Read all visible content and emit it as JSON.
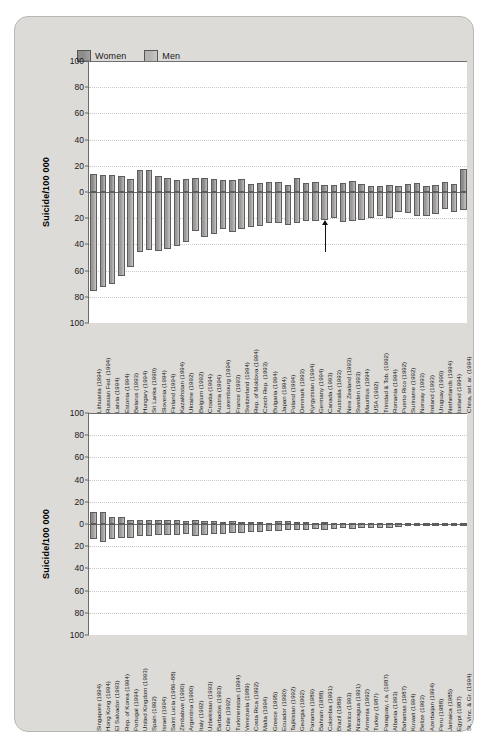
{
  "figure": {
    "background_color": "#dddbd8",
    "plot_background": "#ffffff",
    "legend": [
      {
        "key": "women",
        "label": "Women",
        "color": "#8e8d8b"
      },
      {
        "key": "men",
        "label": "Men",
        "color": "#b6b5b3"
      }
    ]
  },
  "chart_data": [
    {
      "id": "panel-top",
      "type": "bar",
      "orientation": "vertical-diverging",
      "title": "",
      "xlabel": "",
      "ylabel": "Suicide/100 000",
      "ylim": [
        -100,
        100
      ],
      "grid": true,
      "legend_position": "top-left",
      "ytick_labels": [
        "100",
        "80",
        "60",
        "40",
        "20",
        "0",
        "20",
        "40",
        "60",
        "80",
        "100"
      ],
      "ytick_values": [
        100,
        80,
        60,
        40,
        20,
        0,
        -20,
        -40,
        -60,
        -80,
        -100
      ],
      "note": "Women plotted above zero, Men plotted below zero (absolute rates). Sorted by descending male rate.",
      "series": [
        {
          "name": "Women",
          "direction": "up"
        },
        {
          "name": "Men",
          "direction": "down"
        }
      ],
      "categories": [
        "Lithuania (1994)",
        "Russian Fed. (1994)",
        "Latvia (1994)",
        "Estonia (1994)",
        "Belarus (1993)",
        "Hungary (1994)",
        "Sri Lanka (1990)",
        "Slovenia (1994)",
        "Finland (1994)",
        "Kazakhstan (1994)",
        "Ukraine (1992)",
        "Belgium (1992)",
        "Croatia (1994)",
        "Austria (1994)",
        "Luxembourg (1994)",
        "France (1993)",
        "Switzerland (1994)",
        "Rep. of Moldova (1994)",
        "Czech Rep. (1993)",
        "Bulgaria (1994)",
        "Japan (1994)",
        "Poland (1994)",
        "Denmark (1993)",
        "Kyrgyzstan (1994)",
        "Germany (1994)",
        "Canada (1993)",
        "Australia (1993)",
        "New Zealand (1993)",
        "Sweden (1993)",
        "Mauritius (1994)",
        "USA (1992)",
        "Trinidad & Tob. (1992)",
        "Romania (1994)",
        "Puerto Rico (1992)",
        "Suriname (1992)",
        "Norway (1993)",
        "Ireland (1993)",
        "Uruguay (1990)",
        "Netherlands (1994)",
        "Iceland (1994)",
        "China, sel. ar. (1994)"
      ],
      "women_values": [
        13.4,
        12.6,
        13.0,
        12.0,
        9.6,
        16.8,
        16.6,
        12.0,
        11.0,
        9.2,
        10.2,
        10.4,
        10.8,
        10.0,
        8.8,
        9.5,
        10.2,
        6.0,
        7.0,
        7.6,
        8.0,
        5.0,
        10.6,
        6.6,
        8.0,
        5.6,
        5.6,
        6.6,
        8.6,
        6.2,
        4.6,
        4.4,
        5.6,
        4.8,
        6.0,
        7.0,
        4.2,
        5.2,
        8.0,
        6.0,
        17.6
      ],
      "men_values": [
        75.6,
        72.9,
        70.0,
        64.3,
        57.0,
        46.0,
        44.6,
        45.0,
        43.4,
        41.0,
        38.0,
        30.0,
        34.0,
        32.0,
        28.0,
        30.4,
        28.0,
        27.0,
        26.0,
        24.0,
        23.4,
        25.0,
        24.0,
        22.0,
        22.0,
        21.0,
        20.0,
        23.0,
        22.0,
        21.0,
        19.8,
        18.0,
        20.0,
        15.0,
        16.0,
        18.0,
        18.0,
        16.6,
        13.0,
        15.0,
        13.4
      ],
      "annotation": {
        "type": "arrow",
        "points_to_category": "Canada (1993)",
        "direction": "up",
        "label": ""
      }
    },
    {
      "id": "panel-bottom",
      "type": "bar",
      "orientation": "vertical-diverging",
      "title": "",
      "xlabel": "",
      "ylabel": "Suicide/100 000",
      "ylim": [
        -100,
        100
      ],
      "grid": true,
      "ytick_labels": [
        "100",
        "80",
        "60",
        "40",
        "20",
        "0",
        "20",
        "40",
        "60",
        "80",
        "100"
      ],
      "ytick_values": [
        100,
        80,
        60,
        40,
        20,
        0,
        -20,
        -40,
        -60,
        -80,
        -100
      ],
      "series": [
        {
          "name": "Women",
          "direction": "up"
        },
        {
          "name": "Men",
          "direction": "down"
        }
      ],
      "categories": [
        "Singapore (1994)",
        "Hong Kong (1994)",
        "El Salvador (1993)",
        "Rep. of Korea (1994)",
        "Portugal (1994)",
        "United Kingdom (1993)",
        "Spain (1992)",
        "Israel (1994)",
        "Saint Lucia (1986–88)",
        "Zimbabwe (1990)",
        "Argentina (1990)",
        "Italy (1992)",
        "Uzbekistan (1993)",
        "Barbados (1993)",
        "Chile (1992)",
        "Turkmenistan (1994)",
        "Venezuela (1989)",
        "Costa Rica (1992)",
        "Malta (1994)",
        "Greece (1995)",
        "Ecuador (1990)",
        "Tajikistan (1992)",
        "Georgia (1992)",
        "Panama (1989)",
        "Bahrain (1988)",
        "Colombia (1991)",
        "Brazil (1989)",
        "Mexico (1993)",
        "Nicaragua (1991)",
        "Armenia (1992)",
        "Turkey (1987)",
        "Paraguay, r.a. (1987)",
        "Albania (1993)",
        "Bahamas (1987)",
        "Kuwait (1994)",
        "Belize (1993)",
        "Azerbaijan (1994)",
        "Peru (1988)",
        "Jamaica (1985)",
        "Egypt (1987)",
        "St. Vinc. & Gr. (1994)"
      ],
      "women_values": [
        10.4,
        10.8,
        6.6,
        6.2,
        4.0,
        3.2,
        4.0,
        3.4,
        3.6,
        3.2,
        3.0,
        3.6,
        3.0,
        3.0,
        2.0,
        2.6,
        2.2,
        1.8,
        2.0,
        1.0,
        2.4,
        2.6,
        1.8,
        1.6,
        1.2,
        1.6,
        1.2,
        1.0,
        1.2,
        1.2,
        1.0,
        1.0,
        0.8,
        0.8,
        0.6,
        0.6,
        0.6,
        0.6,
        0.4,
        0.2,
        0.2
      ],
      "men_values": [
        13.8,
        16.2,
        13.2,
        12.2,
        12.2,
        11.0,
        11.0,
        9.6,
        9.8,
        10.0,
        9.4,
        10.6,
        9.8,
        9.2,
        9.0,
        8.2,
        8.0,
        7.6,
        7.4,
        6.0,
        6.4,
        5.6,
        5.4,
        5.6,
        4.6,
        5.4,
        4.8,
        4.0,
        4.4,
        3.6,
        3.4,
        3.6,
        3.2,
        2.6,
        2.0,
        1.8,
        1.6,
        1.4,
        1.2,
        0.6,
        0.4
      ]
    }
  ]
}
